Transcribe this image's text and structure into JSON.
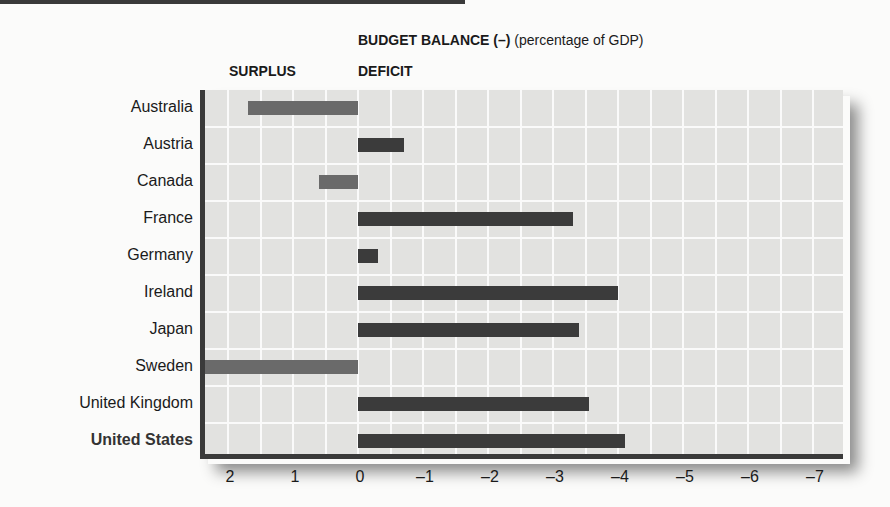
{
  "header": {
    "title_bold": "BUDGET BALANCE (–)",
    "title_rest": " (percentage of GDP)",
    "surplus_label": "SURPLUS",
    "deficit_label": "DEFICIT"
  },
  "colors": {
    "deficit_bar": "#3b3b3b",
    "surplus_bar": "#6a6a6a",
    "plot_bg": "#e2e2e0",
    "grid": "#fafafa",
    "axis": "#3a3a3a"
  },
  "chart_data": {
    "type": "bar",
    "orientation": "horizontal",
    "title": "BUDGET BALANCE (–) (percentage of GDP)",
    "xlabel": "",
    "ylabel": "",
    "annotations": [
      "SURPLUS",
      "DEFICIT"
    ],
    "categories": [
      "Australia",
      "Austria",
      "Canada",
      "France",
      "Germany",
      "Ireland",
      "Japan",
      "Sweden",
      "United Kingdom",
      "United States"
    ],
    "values": [
      1.7,
      -0.7,
      0.6,
      -3.3,
      -0.3,
      -4.0,
      -3.4,
      2.4,
      -3.55,
      -4.1
    ],
    "note": "Positive = surplus (drawn left of 0), negative = deficit (drawn right of 0)",
    "xlim": [
      2.4,
      -7.5
    ],
    "xticks": [
      "2",
      "1",
      "0",
      "–1",
      "–2",
      "–3",
      "–4",
      "–5",
      "–6",
      "–7"
    ],
    "xtick_values": [
      2,
      1,
      0,
      -1,
      -2,
      -3,
      -4,
      -5,
      -6,
      -7
    ],
    "grid": true,
    "legend": "none",
    "highlighted_category": "United States"
  }
}
